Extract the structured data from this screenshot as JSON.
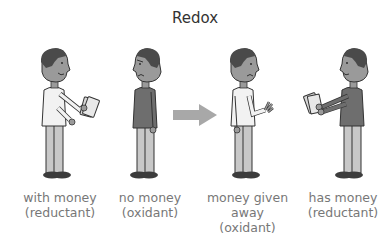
{
  "title": "Redox",
  "colors": {
    "title": "#333333",
    "caption": "#777777",
    "skin": "#9a9a9a",
    "hair": "#4a4a4a",
    "shirt_light": "#f2f2f2",
    "shirt_dark": "#6e6e6e",
    "pants": "#c8c8c8",
    "shoes": "#3c3c3c",
    "arrow": "#a8a8a8",
    "money": "#d8d8d8"
  },
  "figures": [
    {
      "id": "person-with-money",
      "caption_line1": "with money",
      "caption_line2": "(reductant)",
      "caption_line3": "",
      "expression": "smiling",
      "holding_money": true,
      "shirt": "light"
    },
    {
      "id": "person-no-money",
      "caption_line1": "no money",
      "caption_line2": "(oxidant)",
      "caption_line3": "",
      "expression": "frowning",
      "holding_money": false,
      "shirt": "dark"
    },
    {
      "id": "person-money-given-away",
      "caption_line1": "money given",
      "caption_line2": "away",
      "caption_line3": "(oxidant)",
      "expression": "frowning",
      "holding_money": false,
      "shirt": "light"
    },
    {
      "id": "person-has-money",
      "caption_line1": "has money",
      "caption_line2": "(reductant)",
      "caption_line3": "",
      "expression": "smiling",
      "holding_money": true,
      "shirt": "dark"
    }
  ],
  "arrow": {
    "direction": "right",
    "icon": "arrow-right-icon"
  }
}
